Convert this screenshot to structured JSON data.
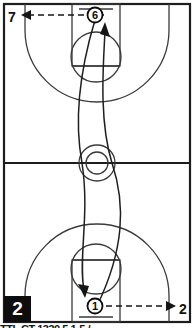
{
  "diagram": {
    "play_number": "2",
    "court": {
      "type": "full-court",
      "line_color": "#2b2b2b",
      "border_color": "#1a1a1a",
      "background": "#ffffff",
      "features": [
        "outer-boundary",
        "center-line",
        "center-circle-inner",
        "center-circle-outer",
        "top-key",
        "top-free-throw-circle",
        "top-three-point-arc",
        "top-backboard",
        "bottom-key",
        "bottom-free-throw-circle",
        "bottom-three-point-arc",
        "bottom-backboard"
      ]
    },
    "players": [
      {
        "id": "player-6",
        "label": "6",
        "position_name": "top-baseline-center",
        "x": 95,
        "y": 15
      },
      {
        "id": "player-1",
        "label": "1",
        "position_name": "bottom-baseline-center",
        "x": 95,
        "y": 306
      }
    ],
    "pass_arrows": [
      {
        "id": "pass-to-7",
        "label": "7",
        "style": "dashed",
        "direction": "left",
        "from_name": "player-6",
        "to_name": "label-7"
      },
      {
        "id": "pass-to-2",
        "label": "2",
        "style": "dashed",
        "direction": "right",
        "from_name": "player-1",
        "to_name": "label-2-right"
      }
    ],
    "movement_paths": [
      {
        "id": "cut-up",
        "style": "solid-curve",
        "direction": "up",
        "arrowhead_name": "arrowhead-up",
        "from_name": "player-1",
        "to_name": "top-key"
      },
      {
        "id": "cut-down",
        "style": "solid-curve",
        "direction": "down",
        "arrowhead_name": "arrowhead-down",
        "from_name": "player-6",
        "to_name": "bottom-key"
      }
    ],
    "footer_caption": "TTL CT 1330 5 1-5 /"
  }
}
